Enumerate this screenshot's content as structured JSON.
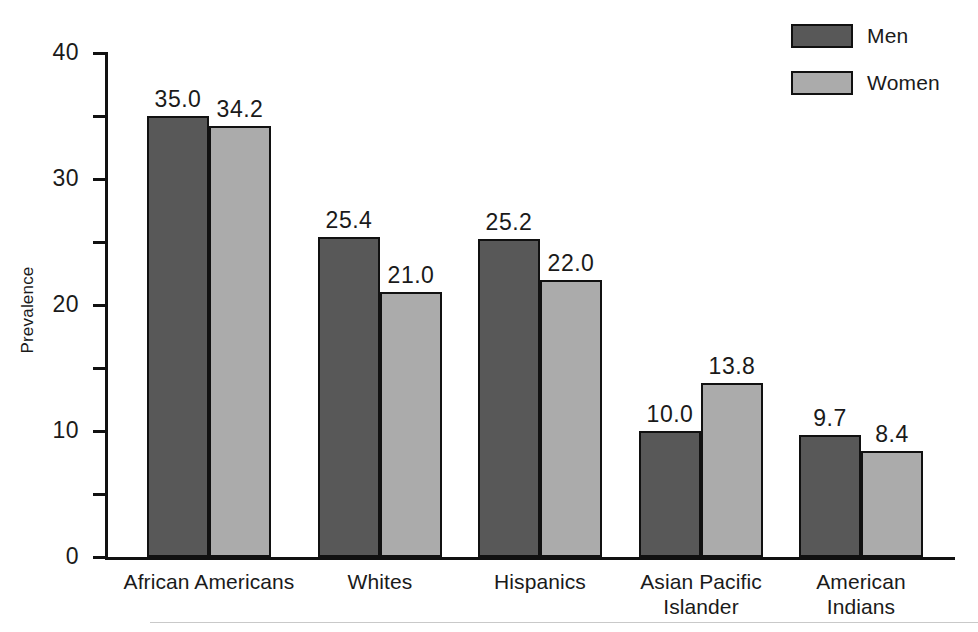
{
  "chart_data": {
    "type": "bar",
    "title": "",
    "subtitle": "",
    "xlabel": "",
    "ylabel": "Prevalence",
    "ylim": [
      0,
      40
    ],
    "ytick_labels": [
      "0",
      "10",
      "20",
      "30",
      "40"
    ],
    "ytick_values": [
      0,
      10,
      20,
      30,
      40
    ],
    "minor_tick_values": [
      5,
      15,
      25,
      35
    ],
    "grid": false,
    "legend_position": "top-right",
    "categories": [
      "African Americans",
      "Whites",
      "Hispanics",
      "Asian Pacific\nIslander",
      "American Indians"
    ],
    "series": [
      {
        "name": "Men",
        "color": "#585858",
        "values": [
          35.0,
          25.4,
          25.2,
          10.0,
          9.7
        ],
        "labels": [
          "35.0",
          "25.4",
          "25.2",
          "10.0",
          "9.7"
        ]
      },
      {
        "name": "Women",
        "color": "#ababab",
        "values": [
          34.2,
          21.0,
          22.0,
          13.8,
          8.4
        ],
        "labels": [
          "34.2",
          "21.0",
          "22.0",
          "13.8",
          "8.4"
        ]
      }
    ]
  },
  "legend": {
    "items": [
      {
        "label": "Men",
        "color": "#585858"
      },
      {
        "label": "Women",
        "color": "#ababab"
      }
    ]
  },
  "axes": {
    "y_label": "Prevalence"
  }
}
